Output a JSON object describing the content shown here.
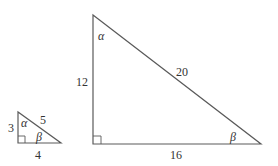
{
  "small_triangle": {
    "vertices": {
      "top": [
        18,
        112
      ],
      "right_angle": [
        18,
        143
      ],
      "right": [
        61,
        143
      ]
    },
    "labels": {
      "vertical_side": "3",
      "horizontal_side": "4",
      "hypotenuse": "5",
      "top_angle": "α",
      "right_angle_label": "β"
    }
  },
  "large_triangle": {
    "vertices": {
      "top": [
        93,
        15
      ],
      "right_angle": [
        93,
        144
      ],
      "right": [
        261,
        144
      ]
    },
    "labels": {
      "vertical_side": "12",
      "horizontal_side": "16",
      "hypotenuse": "20",
      "top_angle": "α",
      "right_angle_label": "β"
    }
  },
  "colors": {
    "stroke": "#5a5a5a",
    "text": "#333333"
  }
}
